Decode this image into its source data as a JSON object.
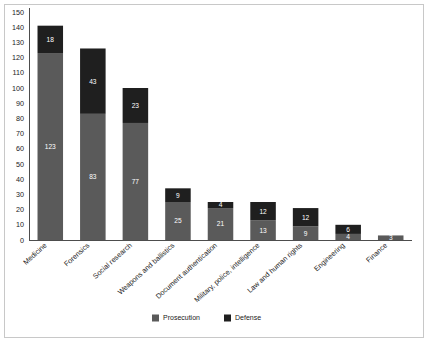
{
  "chart_data": {
    "type": "bar",
    "subtype": "stacked-vertical",
    "title": "",
    "xlabel": "",
    "ylabel": "",
    "ylim": [
      0,
      150
    ],
    "ytick_step": 10,
    "yticks": [
      0,
      10,
      20,
      30,
      40,
      50,
      60,
      70,
      80,
      90,
      100,
      110,
      120,
      130,
      140,
      150
    ],
    "grid": false,
    "legend_position": "bottom-center",
    "categories": [
      "Medicine",
      "Forensics",
      "Social research",
      "Weapons and ballistics",
      "Document authentication",
      "Military, police, intelligence",
      "Law and human rights",
      "Engineering",
      "Finance"
    ],
    "series": [
      {
        "name": "Prosecution",
        "color": "#5a5a5a",
        "values": [
          123,
          83,
          77,
          25,
          21,
          13,
          9,
          4,
          3
        ]
      },
      {
        "name": "Defense",
        "color": "#1f1f1f",
        "values": [
          18,
          43,
          23,
          9,
          4,
          12,
          12,
          6,
          0
        ]
      }
    ],
    "totals": [
      141,
      126,
      100,
      34,
      25,
      25,
      21,
      10,
      3
    ],
    "bar_labels": {
      "Prosecution": [
        "123",
        "83",
        "77",
        "25",
        "21",
        "13",
        "9",
        "4",
        "3"
      ],
      "Defense": [
        "18",
        "43",
        "23",
        "9",
        "4",
        "12",
        "12",
        "6",
        ""
      ]
    }
  },
  "legend": {
    "items": [
      {
        "label": "Prosecution",
        "color": "#5a5a5a"
      },
      {
        "label": "Defense",
        "color": "#1f1f1f"
      }
    ]
  },
  "colors": {
    "prosecution": "#5a5a5a",
    "defense": "#1f1f1f",
    "axis": "#4d4d4d",
    "frame": "#c8c8c8",
    "background": "#ffffff",
    "text": "#1a1a1a"
  }
}
